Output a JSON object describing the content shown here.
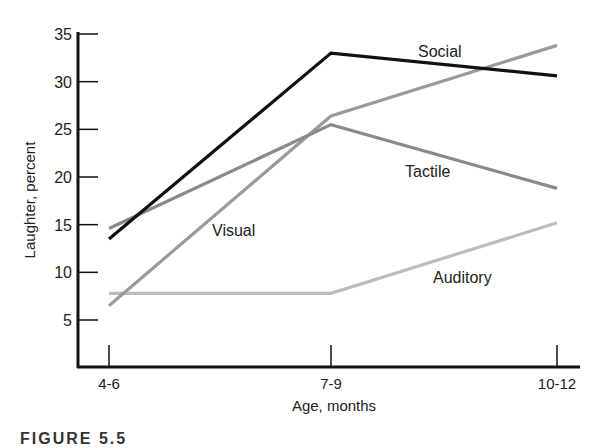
{
  "chart_data": {
    "type": "line",
    "title": "",
    "xlabel": "Age, months",
    "ylabel": "Laughter, percent",
    "categories": [
      "4-6",
      "7-9",
      "10-12"
    ],
    "ylim": [
      0,
      35
    ],
    "yticks": [
      5,
      10,
      15,
      20,
      25,
      30,
      35
    ],
    "grid": false,
    "legend_position": "inline labels",
    "series": [
      {
        "name": "Social",
        "values": [
          13.5,
          33.0,
          30.6
        ],
        "color": "#111111",
        "label_pos": [
          418,
          57
        ]
      },
      {
        "name": "Tactile",
        "values": [
          14.6,
          25.5,
          18.8
        ],
        "color": "#8a8a8a",
        "label_pos": [
          405,
          177
        ]
      },
      {
        "name": "Visual",
        "values": [
          6.5,
          26.4,
          33.8
        ],
        "color": "#9a9a9a",
        "label_pos": [
          212,
          236
        ]
      },
      {
        "name": "Auditory",
        "values": [
          7.8,
          7.8,
          15.2
        ],
        "color": "#bdbdbd",
        "label_pos": [
          433,
          283
        ]
      }
    ]
  },
  "axes": {
    "x_label": "Age, months",
    "y_label": "Laughter, percent",
    "x_ticks": [
      "4-6",
      "7-9",
      "10-12"
    ],
    "y_ticks": [
      "5",
      "10",
      "15",
      "20",
      "25",
      "30",
      "35"
    ]
  },
  "caption": "FIGURE 5.5"
}
